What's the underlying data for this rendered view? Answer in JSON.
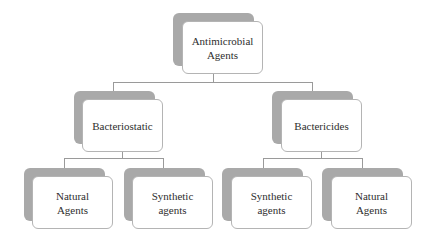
{
  "diagram": {
    "type": "hierarchy",
    "root": {
      "label": "Antimicrobial\nAgents",
      "children": [
        {
          "label": "Bacteriostatic",
          "children": [
            {
              "label": "Natural\nAgents"
            },
            {
              "label": "Synthetic\nagents"
            }
          ]
        },
        {
          "label": "Bactericides",
          "children": [
            {
              "label": "Synthetic\nagents"
            },
            {
              "label": "Natural\nAgents"
            }
          ]
        }
      ]
    }
  },
  "nodes": {
    "root": "Antimicrobial\nAgents",
    "bacteriostatic": "Bacteriostatic",
    "bactericides": "Bactericides",
    "leaf1": "Natural\nAgents",
    "leaf2": "Synthetic\nagents",
    "leaf3": "Synthetic\nagents",
    "leaf4": "Natural\nAgents"
  },
  "colors": {
    "shadow": "#a9a9a9",
    "box_border": "#b4b4b4",
    "connector": "#9a9a9a",
    "text": "#2e2e2e"
  }
}
